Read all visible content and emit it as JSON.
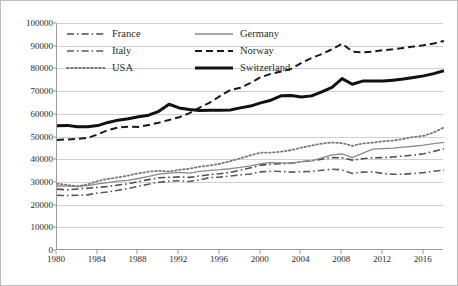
{
  "chart_data": {
    "type": "line",
    "title": "",
    "xlabel": "",
    "ylabel": "",
    "xlim": [
      1980,
      2018
    ],
    "ylim": [
      0,
      100000
    ],
    "ytick_step": 10000,
    "xtick_step": 4,
    "grid": true,
    "legend_position": "top-inside",
    "yticks": [
      "0",
      "10000",
      "20000",
      "30000",
      "40000",
      "50000",
      "60000",
      "70000",
      "80000",
      "90000",
      "100000"
    ],
    "xticks": [
      "1980",
      "1984",
      "1988",
      "1992",
      "1996",
      "2000",
      "2004",
      "2008",
      "2012",
      "2016"
    ],
    "x": [
      1980,
      1981,
      1982,
      1983,
      1984,
      1985,
      1986,
      1987,
      1988,
      1989,
      1990,
      1991,
      1992,
      1993,
      1994,
      1995,
      1996,
      1997,
      1998,
      1999,
      2000,
      2001,
      2002,
      2003,
      2004,
      2005,
      2006,
      2007,
      2008,
      2009,
      2010,
      2011,
      2012,
      2013,
      2014,
      2015,
      2016,
      2017,
      2018
    ],
    "series": [
      {
        "name": "France",
        "color": "#4d4d4d",
        "style": "dash-dot",
        "width": 1.6,
        "values": [
          26800,
          26500,
          26900,
          27200,
          27600,
          28000,
          28600,
          29200,
          30100,
          31000,
          31800,
          32000,
          32200,
          32000,
          32600,
          33200,
          33600,
          34200,
          35200,
          36200,
          37400,
          37800,
          38000,
          38200,
          38900,
          39300,
          40000,
          40700,
          40600,
          39600,
          40200,
          40600,
          40700,
          41000,
          41400,
          41800,
          42400,
          43400,
          44600
        ]
      },
      {
        "name": "Germany",
        "color": "#8a8a8a",
        "style": "solid-thin",
        "width": 1.3,
        "values": [
          28200,
          28100,
          28000,
          28400,
          29100,
          29700,
          30300,
          30700,
          31500,
          32400,
          33400,
          33900,
          34200,
          33900,
          34600,
          35100,
          35400,
          35800,
          36400,
          37100,
          38000,
          38500,
          38400,
          38300,
          38900,
          39300,
          40600,
          41900,
          42300,
          40700,
          42600,
          44400,
          44700,
          44900,
          45300,
          45700,
          46200,
          46900,
          47400
        ]
      },
      {
        "name": "Italy",
        "color": "#5a5a5a",
        "style": "dash-dot",
        "width": 1.6,
        "values": [
          24100,
          24000,
          24100,
          24300,
          25100,
          25600,
          26300,
          27100,
          28100,
          29000,
          29800,
          30300,
          30500,
          30200,
          30900,
          31900,
          32100,
          32600,
          33100,
          33500,
          34400,
          34700,
          34600,
          34300,
          34500,
          34600,
          35100,
          35600,
          35300,
          33700,
          34300,
          34400,
          33700,
          33400,
          33400,
          33700,
          34100,
          34700,
          35200
        ]
      },
      {
        "name": "Norway",
        "color": "#1a1a1a",
        "style": "dashed",
        "width": 2.0,
        "values": [
          48500,
          48700,
          48900,
          49400,
          50900,
          52800,
          54000,
          54300,
          54200,
          55100,
          56100,
          57300,
          58500,
          60300,
          62700,
          64900,
          67800,
          70400,
          71500,
          73600,
          76100,
          77600,
          78600,
          79800,
          82400,
          84600,
          86300,
          88400,
          90900,
          87400,
          87100,
          87400,
          88000,
          88400,
          89000,
          89600,
          90200,
          91000,
          92100
        ]
      },
      {
        "name": "USA",
        "color": "#7a7a7a",
        "style": "dotted",
        "width": 1.8,
        "values": [
          29200,
          28700,
          28000,
          28900,
          30400,
          31300,
          32000,
          32800,
          33800,
          34500,
          34900,
          34600,
          35300,
          35800,
          36700,
          37200,
          38000,
          39100,
          40400,
          41700,
          42900,
          42900,
          43300,
          44000,
          45100,
          46000,
          46900,
          47300,
          47100,
          45900,
          46900,
          47300,
          47900,
          48200,
          48900,
          49800,
          50300,
          51800,
          54000
        ]
      },
      {
        "name": "Switzerland",
        "color": "#111111",
        "style": "solid-thick",
        "width": 3.0,
        "values": [
          54700,
          54900,
          54300,
          54300,
          54800,
          56200,
          57200,
          57800,
          58700,
          59400,
          61100,
          64200,
          62600,
          61900,
          61500,
          61600,
          61600,
          61700,
          62600,
          63400,
          64800,
          66000,
          67900,
          68100,
          67400,
          67900,
          69700,
          71600,
          75500,
          73000,
          74400,
          74500,
          74400,
          74800,
          75300,
          76000,
          76700,
          77700,
          79000
        ]
      }
    ]
  },
  "legend": {
    "entries": [
      {
        "label": "France"
      },
      {
        "label": "Germany"
      },
      {
        "label": "Italy"
      },
      {
        "label": "Norway"
      },
      {
        "label": "USA"
      },
      {
        "label": "Switzerland"
      }
    ]
  }
}
